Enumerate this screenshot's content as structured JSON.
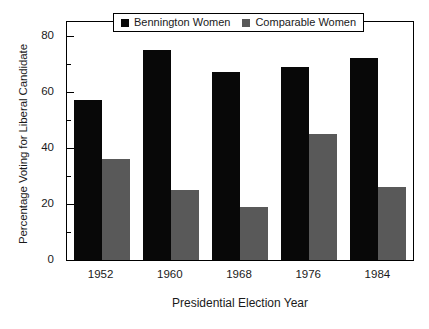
{
  "chart_data": {
    "type": "bar",
    "title": "",
    "xlabel": "Presidential Election Year",
    "ylabel": "Percentage Voting for Liberal Candidate",
    "categories": [
      "1952",
      "1960",
      "1968",
      "1976",
      "1984"
    ],
    "series": [
      {
        "name": "Bennington Women",
        "color": "#080808",
        "values": [
          57,
          75,
          67,
          69,
          72
        ]
      },
      {
        "name": "Comparable Women",
        "color": "#595959",
        "values": [
          36,
          25,
          19,
          45,
          26
        ]
      }
    ],
    "ylim": [
      0,
      85
    ],
    "yticks": [
      0,
      20,
      40,
      60,
      80
    ],
    "ytick_labels": [
      "0",
      "20",
      "40",
      "60",
      "80"
    ],
    "yminor_ticks": [
      10,
      30,
      50,
      70
    ],
    "grid": false,
    "legend_position": "top-center",
    "legend_entries": [
      "Bennington Women",
      "Comparable Women"
    ]
  }
}
